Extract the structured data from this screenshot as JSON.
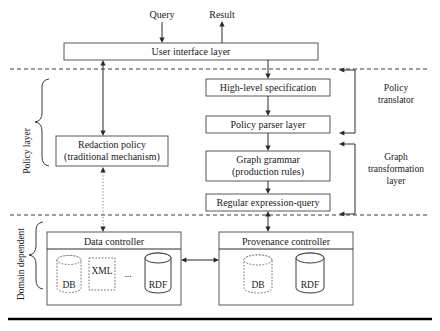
{
  "diagram": {
    "io": {
      "query": "Query",
      "result": "Result"
    },
    "boxes": {
      "user_interface": "User interface layer",
      "redaction_policy_line1": "Redaction policy",
      "redaction_policy_line2": "(traditional mechanism)",
      "high_level_spec": "High-level specification",
      "policy_parser": "Policy parser layer",
      "graph_grammar_line1": "Graph grammar",
      "graph_grammar_line2": "(production rules)",
      "regular_expression_query": "Regular expression-query",
      "data_controller": "Data controller",
      "provenance_controller": "Provenance controller"
    },
    "groups": {
      "policy_layer": "Policy layer",
      "domain_dependent": "Domain dependent",
      "policy_translator_line1": "Policy",
      "policy_translator_line2": "translator",
      "graph_transformation_line1": "Graph",
      "graph_transformation_line2": "transformation",
      "graph_transformation_line3": "layer"
    },
    "stores": {
      "data_controller": [
        {
          "label": "DB",
          "shape": "cylinder-dotted"
        },
        {
          "label": "XML",
          "shape": "square-dotted"
        },
        {
          "label": "...",
          "shape": "ellipsis"
        },
        {
          "label": "RDF",
          "shape": "cylinder-solid"
        }
      ],
      "provenance_controller": [
        {
          "label": "DB",
          "shape": "cylinder-dotted"
        },
        {
          "label": "RDF",
          "shape": "cylinder-solid"
        }
      ]
    },
    "colors": {
      "box_stroke": "#58585a",
      "line": "#2b2b2b",
      "dotted_line": "#8a8a8a",
      "divider": "#3a3a3a",
      "text": "#1a1a1a",
      "background": "#ffffff"
    }
  }
}
